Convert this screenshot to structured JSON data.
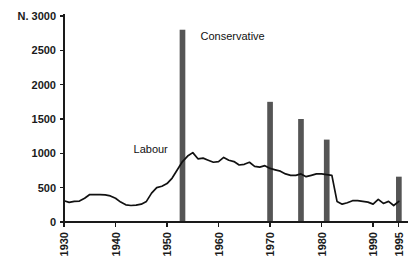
{
  "chart_data": {
    "type": "line",
    "title": "",
    "subtitle": "",
    "xlabel": "",
    "ylabel": "N.",
    "ylim": [
      0,
      3000
    ],
    "xlim": [
      1930,
      1996
    ],
    "grid": false,
    "legend_position": "inline-annotation",
    "y_ticks": [
      {
        "value": 3000,
        "label": "N. 3000"
      },
      {
        "value": 2500,
        "label": "2500"
      },
      {
        "value": 2000,
        "label": "2000"
      },
      {
        "value": 1500,
        "label": "1500"
      },
      {
        "value": 1000,
        "label": "1000"
      },
      {
        "value": 500,
        "label": "500"
      },
      {
        "value": 0,
        "label": "0"
      }
    ],
    "x_ticks": [
      {
        "value": 1930,
        "label": "1930"
      },
      {
        "value": 1940,
        "label": "1940"
      },
      {
        "value": 1950,
        "label": "1950"
      },
      {
        "value": 1960,
        "label": "1960"
      },
      {
        "value": 1970,
        "label": "1970"
      },
      {
        "value": 1980,
        "label": "1980"
      },
      {
        "value": 1990,
        "label": "1990"
      },
      {
        "value": 1995,
        "label": "1995"
      }
    ],
    "annotations": [
      {
        "name": "labour-label",
        "text": "Labour",
        "x": 1943.5,
        "y": 1000
      },
      {
        "name": "conservative-label",
        "text": "Conservative",
        "x": 1956.5,
        "y": 2650
      }
    ],
    "series": [
      {
        "name": "Labour",
        "type": "line",
        "color": "#111111",
        "x": [
          1930,
          1931,
          1932,
          1933,
          1934,
          1935,
          1936,
          1937,
          1938,
          1939,
          1940,
          1941,
          1942,
          1943,
          1944,
          1945,
          1946,
          1947,
          1948,
          1949,
          1950,
          1951,
          1952,
          1953,
          1954,
          1955,
          1956,
          1957,
          1958,
          1959,
          1960,
          1961,
          1962,
          1963,
          1964,
          1965,
          1966,
          1967,
          1968,
          1969,
          1970,
          1971,
          1972,
          1973,
          1974,
          1975,
          1976,
          1977,
          1978,
          1979,
          1980,
          1981,
          1982,
          1983,
          1984,
          1985,
          1986,
          1987,
          1988,
          1989,
          1990,
          1991,
          1992,
          1993,
          1994,
          1995
        ],
        "values": [
          310,
          285,
          300,
          305,
          345,
          400,
          400,
          400,
          395,
          380,
          345,
          290,
          250,
          240,
          245,
          260,
          300,
          420,
          500,
          520,
          560,
          640,
          760,
          880,
          960,
          1010,
          920,
          930,
          900,
          870,
          880,
          940,
          900,
          880,
          830,
          840,
          870,
          810,
          800,
          820,
          780,
          760,
          740,
          700,
          680,
          680,
          700,
          660,
          680,
          700,
          700,
          690,
          680,
          300,
          260,
          280,
          310,
          310,
          300,
          290,
          260,
          330,
          270,
          300,
          240,
          300
        ]
      },
      {
        "name": "Conservative",
        "type": "bar",
        "color": "#555555",
        "bar_width_years": 1.1,
        "x": [
          1953,
          1970,
          1976,
          1981,
          1995
        ],
        "values": [
          2800,
          1750,
          1500,
          1200,
          660
        ]
      }
    ]
  }
}
